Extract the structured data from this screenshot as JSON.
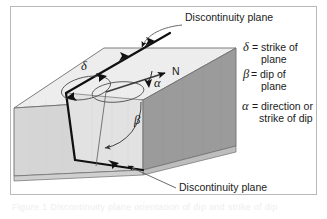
{
  "figure": {
    "title_top_callout": "Discontinuity plane",
    "title_bottom_callout": "Discontinuity plane",
    "north_label": "N",
    "symbols": {
      "delta": "δ",
      "beta": "β",
      "alpha": "α"
    },
    "legend": [
      {
        "symbol": "δ",
        "eq": "=",
        "line1": "strike of",
        "line2": "plane"
      },
      {
        "symbol": "β",
        "eq": "=",
        "line1": "dip of",
        "line2": "plane"
      },
      {
        "symbol": "α",
        "eq": "=",
        "line1": "direction or",
        "line2": "strike of dip"
      }
    ],
    "caption_faint": "Figure 1 Discontinuity plane orientation of dip and strike of dip",
    "colors": {
      "frame_border": "#b9b9b9",
      "top_face": "#ededed",
      "left_face": "#d6d6d6",
      "right_face": "#9b9b9b",
      "discontinuity_face": "#e2e2e2",
      "outline": "#6f6f6f",
      "heavy_line": "#101010",
      "arc_line": "#4a4a4a",
      "text": "#1b1b1b",
      "background": "#ffffff"
    }
  }
}
